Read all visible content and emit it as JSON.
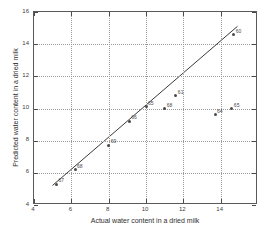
{
  "chart_data": {
    "type": "scatter",
    "title": "",
    "xlabel": "Actual water content in a dried milk",
    "ylabel": "Predicted water content in a dried milk",
    "xlim": [
      4,
      16
    ],
    "ylim": [
      4,
      16
    ],
    "xticks": [
      4,
      6,
      8,
      10,
      12,
      14
    ],
    "yticks": [
      4,
      6,
      8,
      10,
      12,
      14,
      16
    ],
    "xtick_labels": [
      "4",
      "6",
      "8",
      "10",
      "12",
      "14"
    ],
    "ytick_labels": [
      "4",
      "6",
      "8",
      "10",
      "12",
      "14",
      "16"
    ],
    "grid": true,
    "legend": "none",
    "points": [
      {
        "label": "67",
        "x": 5.2,
        "y": 5.3
      },
      {
        "label": "68",
        "x": 6.2,
        "y": 6.2
      },
      {
        "label": "69",
        "x": 8.0,
        "y": 7.7
      },
      {
        "label": "66",
        "x": 9.1,
        "y": 9.2
      },
      {
        "label": "65",
        "x": 10.0,
        "y": 10.1
      },
      {
        "label": "68",
        "x": 11.0,
        "y": 10.0
      },
      {
        "label": "61",
        "x": 11.6,
        "y": 10.8
      },
      {
        "label": "64",
        "x": 13.7,
        "y": 9.6
      },
      {
        "label": "65",
        "x": 14.6,
        "y": 10.0
      },
      {
        "label": "60",
        "x": 14.7,
        "y": 14.6
      }
    ],
    "line": {
      "name": "fit-line",
      "x": [
        5.0,
        15.0
      ],
      "y": [
        5.1,
        15.1
      ]
    },
    "colors": {
      "axis": "#5a5a5a",
      "grid": "#9a9a9a",
      "marker": "#4a4a4a",
      "line": "#3a3a3a",
      "background": "#ffffff"
    }
  }
}
